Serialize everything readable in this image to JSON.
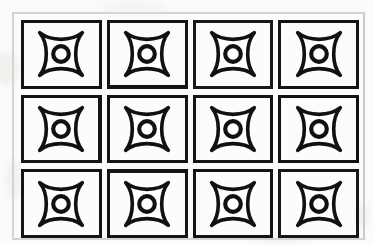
{
  "page": {
    "background_color": "#fbfbfa",
    "frame_color": "#d4d4d2",
    "ink_color": "#141414"
  },
  "grid": {
    "columns": 4,
    "rows": 3,
    "cell_count": 12,
    "cells": [
      {
        "id": "r1c1",
        "row": 1,
        "column": 1,
        "motif": "four-pointed-star-with-ring"
      },
      {
        "id": "r1c2",
        "row": 1,
        "column": 2,
        "motif": "four-pointed-star-with-ring"
      },
      {
        "id": "r1c3",
        "row": 1,
        "column": 3,
        "motif": "four-pointed-star-with-ring"
      },
      {
        "id": "r1c4",
        "row": 1,
        "column": 4,
        "motif": "four-pointed-star-with-ring"
      },
      {
        "id": "r2c1",
        "row": 2,
        "column": 1,
        "motif": "four-pointed-star-with-ring"
      },
      {
        "id": "r2c2",
        "row": 2,
        "column": 2,
        "motif": "four-pointed-star-with-ring"
      },
      {
        "id": "r2c3",
        "row": 2,
        "column": 3,
        "motif": "four-pointed-star-with-ring"
      },
      {
        "id": "r2c4",
        "row": 2,
        "column": 4,
        "motif": "four-pointed-star-with-ring"
      },
      {
        "id": "r3c1",
        "row": 3,
        "column": 1,
        "motif": "four-pointed-star-with-ring"
      },
      {
        "id": "r3c2",
        "row": 3,
        "column": 2,
        "motif": "four-pointed-star-with-ring"
      },
      {
        "id": "r3c3",
        "row": 3,
        "column": 3,
        "motif": "four-pointed-star-with-ring"
      },
      {
        "id": "r3c4",
        "row": 3,
        "column": 4,
        "motif": "four-pointed-star-with-ring"
      }
    ]
  }
}
